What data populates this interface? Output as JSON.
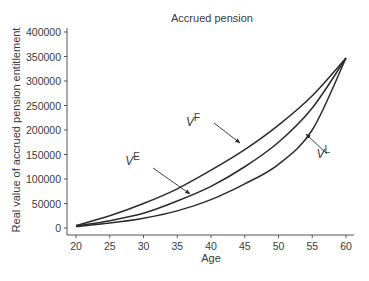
{
  "chart_data": {
    "type": "line",
    "title": "Accrued pension",
    "xlabel": "Age",
    "ylabel": "Real value of accrued pension entitlement",
    "xlim": [
      20,
      60
    ],
    "ylim": [
      0,
      400000
    ],
    "x_ticks": [
      20,
      25,
      30,
      35,
      40,
      45,
      50,
      55,
      60
    ],
    "y_ticks": [
      0,
      50000,
      100000,
      150000,
      200000,
      250000,
      300000,
      350000,
      400000
    ],
    "grid": false,
    "legend": "none (inline arrow annotations)",
    "x": [
      20,
      25,
      30,
      35,
      40,
      45,
      50,
      55,
      60
    ],
    "series": [
      {
        "name": "V^F",
        "label_base": "V",
        "label_sup": "F",
        "values": [
          5000,
          25000,
          50000,
          80000,
          118000,
          160000,
          210000,
          270000,
          347000
        ]
      },
      {
        "name": "V^E",
        "label_base": "V",
        "label_sup": "E",
        "values": [
          4000,
          15000,
          30000,
          55000,
          85000,
          125000,
          175000,
          245000,
          347000
        ]
      },
      {
        "name": "V^L",
        "label_base": "V",
        "label_sup": "L",
        "values": [
          3000,
          10000,
          20000,
          35000,
          58000,
          90000,
          130000,
          200000,
          347000
        ]
      }
    ],
    "annotations": [
      {
        "text": "V^F",
        "points_to": "upper curve near age 45"
      },
      {
        "text": "V^E",
        "points_to": "middle curve near age 37"
      },
      {
        "text": "V^L",
        "points_to": "lower curve near age 55"
      }
    ],
    "line_color": "#2b2b2b",
    "axis_color": "#555555"
  }
}
